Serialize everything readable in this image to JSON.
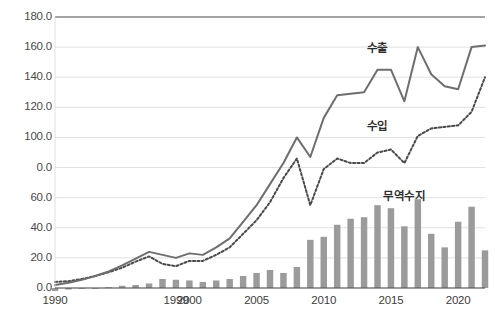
{
  "chart_data": {
    "type": "bar",
    "title": "",
    "subtitle": "",
    "xlabel": "",
    "ylabel": "",
    "ylim": [
      0,
      180
    ],
    "y_ticks": [
      0,
      20,
      40,
      60,
      80,
      100,
      120,
      140,
      160,
      180
    ],
    "y_tick_labels": [
      "0.0",
      "20.0",
      "40.0",
      "60.0",
      "0.0",
      "100.0",
      "120.0",
      "140.0",
      "160.0",
      "180.0"
    ],
    "x_tick_labels": [
      "1990",
      "1999",
      "2000",
      "2005",
      "2010",
      "2015",
      "2020"
    ],
    "x_tick_years": [
      1990,
      1999,
      2000,
      2005,
      2010,
      2015,
      2020
    ],
    "grid": true,
    "legend_position": "inline-annotations",
    "x": [
      1990,
      1991,
      1992,
      1993,
      1994,
      1995,
      1996,
      1997,
      1998,
      1999,
      2000,
      2001,
      2002,
      2003,
      2004,
      2005,
      2006,
      2007,
      2008,
      2009,
      2010,
      2011,
      2012,
      2013,
      2014,
      2015,
      2016,
      2017,
      2018,
      2019,
      2020,
      2021,
      2022
    ],
    "series": [
      {
        "name": "수출",
        "style": "solid-line",
        "color": "#6e6e6e",
        "values": [
          2.0,
          3.5,
          5.5,
          8.0,
          11.0,
          15.0,
          19.5,
          24.0,
          22.0,
          20.0,
          23.0,
          22.0,
          27.0,
          33.0,
          44.0,
          55.0,
          69.0,
          83.0,
          100.0,
          87.0,
          113.0,
          128.0,
          129.0,
          130.0,
          145.0,
          145.0,
          124.0,
          160.0,
          142.0,
          134.0,
          132.0,
          160.0,
          161.0
        ]
      },
      {
        "name": "수입",
        "style": "dotted-line",
        "color": "#4a4a4a",
        "values": [
          4.0,
          4.5,
          6.0,
          8.0,
          10.5,
          13.5,
          17.5,
          21.0,
          16.0,
          14.5,
          18.0,
          18.0,
          22.0,
          27.0,
          36.0,
          45.0,
          57.0,
          73.0,
          86.0,
          55.0,
          79.0,
          86.0,
          83.0,
          83.0,
          90.0,
          92.0,
          83.0,
          101.0,
          106.0,
          107.0,
          108.0,
          117.0,
          140.0
        ]
      },
      {
        "name": "무역수지",
        "style": "bar",
        "color": "#9b9b9b",
        "values": [
          -2.0,
          -1.0,
          -0.5,
          0.0,
          0.5,
          1.5,
          2.0,
          3.0,
          6.0,
          5.5,
          5.0,
          4.0,
          5.0,
          6.0,
          8.0,
          10.0,
          12.0,
          10.0,
          14.0,
          32.0,
          34.0,
          42.0,
          46.0,
          47.0,
          55.0,
          53.0,
          41.0,
          59.0,
          36.0,
          27.0,
          44.0,
          54.0,
          25.0
        ]
      }
    ],
    "annotations": [
      {
        "text": "수출",
        "x": 2014,
        "y": 160
      },
      {
        "text": "수입",
        "x": 2014,
        "y": 108
      },
      {
        "text": "무역수지",
        "x": 2016,
        "y": 62
      }
    ]
  },
  "colors": {
    "axis": "#4a4a4a",
    "grid": "#dcdcdc",
    "exports_line": "#6e6e6e",
    "imports_line": "#4a4a4a",
    "balance_bar": "#9b9b9b",
    "background": "#ffffff",
    "tick_text": "#4a4a4a"
  }
}
